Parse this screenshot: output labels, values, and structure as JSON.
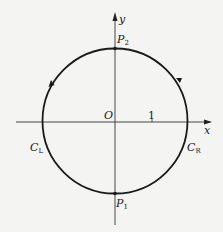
{
  "diagram": {
    "type": "complex-plane contour",
    "axes": {
      "x_label": "x",
      "y_label": "y",
      "origin_label": "O",
      "tick_label": "1"
    },
    "circle": {
      "description": "unit circle traversed counterclockwise",
      "direction_markers": [
        "arrow on left arc",
        "arrow on right arc"
      ]
    },
    "points": {
      "top": {
        "name": "P",
        "sub": "2"
      },
      "bottom": {
        "name": "P",
        "sub": "1"
      }
    },
    "arcs": {
      "left": {
        "name": "C",
        "sub": "L"
      },
      "right": {
        "name": "C",
        "sub": "R"
      }
    },
    "colors": {
      "background": "#f4f4f2",
      "stroke": "#1a1a1a"
    }
  }
}
